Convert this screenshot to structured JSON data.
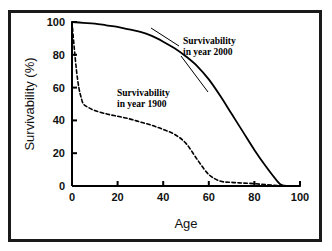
{
  "figure": {
    "background": "#ffffff",
    "border_color": "#1a1a1a",
    "axis_color": "#000000"
  },
  "chart_data": {
    "type": "line",
    "title": "",
    "xlabel": "Age",
    "ylabel": "Survivability (%)",
    "xlim": [
      0,
      100
    ],
    "ylim": [
      0,
      100
    ],
    "xticks": [
      0,
      20,
      40,
      60,
      80,
      100
    ],
    "yticks": [
      0,
      20,
      40,
      60,
      80,
      100
    ],
    "xticklabels": [
      "0",
      "20",
      "40",
      "60",
      "80",
      "100"
    ],
    "yticklabels": [
      "0",
      "20",
      "40",
      "60",
      "80",
      "100"
    ],
    "grid": false,
    "legend": "inline-annotations",
    "series": [
      {
        "name": "Survivability in year 2000",
        "style": "solid",
        "color": "#000000",
        "x": [
          0,
          5,
          10,
          15,
          20,
          25,
          30,
          35,
          40,
          45,
          50,
          55,
          60,
          65,
          70,
          75,
          80,
          85,
          90,
          92,
          95,
          100
        ],
        "values": [
          100,
          99.5,
          99,
          98,
          97,
          95.5,
          94,
          91.5,
          88,
          84,
          79,
          73,
          65,
          55,
          44,
          33,
          22,
          12,
          3,
          0.5,
          0,
          0
        ]
      },
      {
        "name": "Survivability in year 1900",
        "style": "dashed",
        "color": "#000000",
        "x": [
          0,
          1,
          2,
          3,
          4,
          5,
          7,
          10,
          15,
          20,
          25,
          30,
          35,
          40,
          45,
          50,
          55,
          60,
          65,
          70,
          75,
          80,
          85,
          90,
          95,
          100
        ],
        "values": [
          100,
          84,
          70,
          60,
          54,
          50,
          48,
          46,
          44,
          42.5,
          41,
          39,
          37,
          34.5,
          31.5,
          26,
          16,
          7,
          3,
          2.2,
          1.8,
          1.4,
          0.8,
          0.3,
          0,
          0
        ]
      }
    ],
    "annotations": [
      {
        "id": "annotation-2000",
        "line1": "Survivability",
        "line2": "in year 2000",
        "x_px": 183,
        "y_px": 40
      },
      {
        "id": "annotation-1900",
        "line1": "Survivability",
        "line2": "in year 1900",
        "x_px": 117,
        "y_px": 92
      }
    ]
  }
}
